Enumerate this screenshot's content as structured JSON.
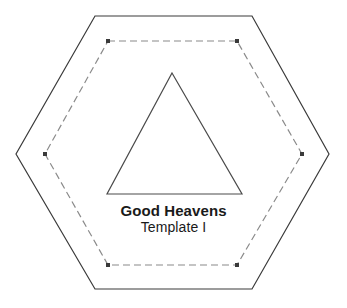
{
  "document": {
    "kind": "quilting-template-diagram",
    "background_color": "#ffffff",
    "width": 347,
    "height": 308
  },
  "labels": {
    "title": "Good Heavens",
    "subtitle": "Template I"
  },
  "colors": {
    "cutting_line": "#3a3a3a",
    "sewing_line": "#8a8a8a",
    "shape_line": "#4a4a4a",
    "text": "#1a1a1a",
    "background": "#ffffff"
  },
  "shapes": {
    "outer_hexagon": {
      "name": "cutting-line-hexagon",
      "style": "solid",
      "stroke": "#3a3a3a",
      "stroke_width": 1.2,
      "points": "95,16 252,16 329,154 252,289 95,289 16,154"
    },
    "inner_hexagon": {
      "name": "sewing-line-hexagon",
      "style": "dashed",
      "stroke": "#8a8a8a",
      "stroke_width": 1.2,
      "dash_pattern": "7,4",
      "points": "108,41 237,41 302,154 237,265 108,265 45,154",
      "corner_markers": [
        "108,41",
        "237,41",
        "302,154",
        "237,265",
        "108,265",
        "45,154"
      ]
    },
    "triangle": {
      "name": "template-triangle",
      "style": "solid",
      "stroke": "#4a4a4a",
      "stroke_width": 1.2,
      "points": "172,73 242,194 107,194"
    }
  }
}
